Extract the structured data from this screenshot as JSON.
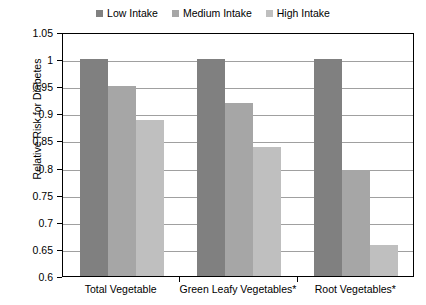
{
  "chart_data": {
    "type": "bar",
    "title": "",
    "subtitle": "",
    "xlabel": "",
    "ylabel": "Relative Risk for Diabetes",
    "categories": [
      "Total Vegetable",
      "Green Leafy Vegetables*",
      "Root Vegetables*"
    ],
    "series": [
      {
        "name": "Low Intake",
        "color": "#808080",
        "values": [
          1.0,
          1.0,
          1.0
        ]
      },
      {
        "name": "Medium Intake",
        "color": "#a6a6a6",
        "values": [
          0.95,
          0.92,
          0.795
        ]
      },
      {
        "name": "High Intake",
        "color": "#bfbfbf",
        "values": [
          0.888,
          0.838,
          0.657
        ]
      }
    ],
    "ylim": [
      0.6,
      1.05
    ],
    "ytick_step": 0.05,
    "ytick_labels": [
      "1.05",
      "1",
      "0.95",
      "0.9",
      "0.85",
      "0.8",
      "0.75",
      "0.7",
      "0.65",
      "0.6"
    ],
    "ytick_values": [
      1.05,
      1.0,
      0.95,
      0.9,
      0.85,
      0.8,
      0.75,
      0.7,
      0.65,
      0.6
    ],
    "grid": true,
    "grid_axis": "y",
    "legend_position": "top",
    "plot_border": true,
    "plot_background": "#ffffff",
    "grid_color": "#a0a0a0",
    "axis_color": "#000000"
  },
  "legend": {
    "entries": [
      {
        "label": "Low Intake"
      },
      {
        "label": "Medium Intake"
      },
      {
        "label": "High Intake"
      }
    ]
  }
}
